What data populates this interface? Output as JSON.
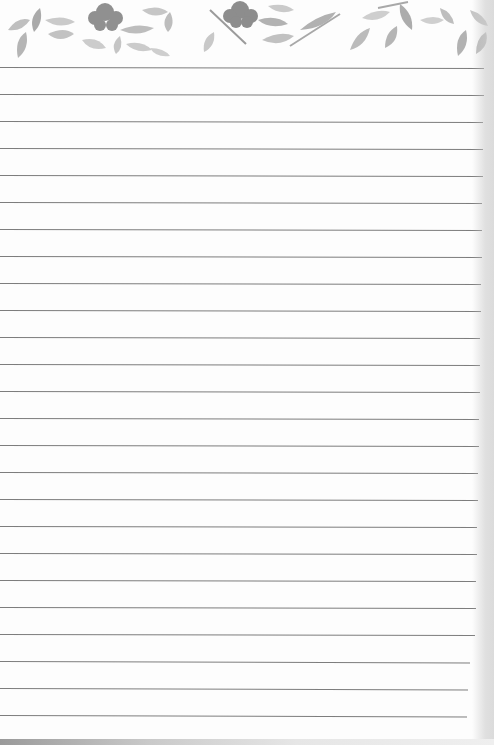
{
  "notepad": {
    "style": "lined notepad sheet with watercolor leaf border",
    "header": {
      "decoration": "watercolor-leaves-and-flowers",
      "colors": {
        "leaf_light": "#c8c8c8",
        "leaf_mid": "#a8a8a8",
        "leaf_dark": "#8a8a8a",
        "flower": "#7a7a7a"
      }
    },
    "lines": {
      "count": 25,
      "first_y": 67,
      "spacing": 27,
      "color": "#7d7d7d"
    },
    "paper_color": "#fdfdfd"
  }
}
